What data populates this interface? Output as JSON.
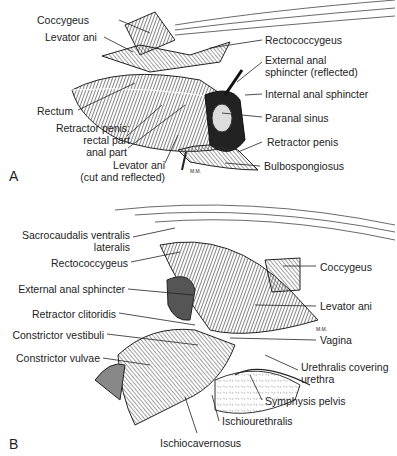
{
  "figure": {
    "panels": [
      {
        "id": "A",
        "letter": "A",
        "labels": {
          "coccygeus": "Coccygeus",
          "levator_ani": "Levator ani",
          "rectum": "Rectum",
          "retractor_penis_parts": "Retractor penis:",
          "rectal_part": "rectal part",
          "anal_part": "anal part",
          "levator_ani_cut_1": "Levator ani",
          "levator_ani_cut_2": "(cut and reflected)",
          "rectococcygeus": "Rectococcygeus",
          "ext_anal_sphincter_1": "External anal",
          "ext_anal_sphincter_2": "sphincter (reflected)",
          "internal_anal_sphincter": "Internal anal sphincter",
          "paranal_sinus": "Paranal sinus",
          "retractor_penis": "Retractor penis",
          "bulbospongiosus": "Bulbospongiosus"
        },
        "signature": "M.M."
      },
      {
        "id": "B",
        "letter": "B",
        "labels": {
          "sacrocaudalis_1": "Sacrocaudalis ventralis",
          "sacrocaudalis_2": "lateralis",
          "rectococcygeus": "Rectococcygeus",
          "external_anal_sphincter": "External anal sphincter",
          "retractor_clitoridis": "Retractor clitoridis",
          "constrictor_vestibuli": "Constrictor vestibuli",
          "constrictor_vulvae": "Constrictor vulvae",
          "coccygeus": "Coccygeus",
          "levator_ani": "Levator ani",
          "vagina": "Vagina",
          "urethralis_1": "Urethralis covering",
          "urethralis_2": "urethra",
          "symphysis_pelvis": "Symphysis pelvis",
          "ischiourethralis": "Ischiourethralis",
          "ischiocavernosus": "Ischiocavernosus"
        },
        "signature": "M.M."
      }
    ]
  }
}
